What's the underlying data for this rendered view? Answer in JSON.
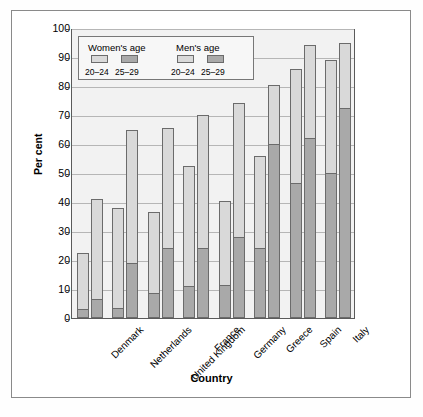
{
  "chart_data": {
    "type": "bar",
    "subtype": "grouped-stacked",
    "title": "",
    "xlabel": "Country",
    "ylabel": "Per cent",
    "ylim": [
      0,
      100
    ],
    "ytick_step": 10,
    "yticks": [
      0,
      10,
      20,
      30,
      40,
      50,
      60,
      70,
      80,
      90,
      100
    ],
    "grid": "horizontal",
    "legend_position": "top-left-inside",
    "categories": [
      "Denmark",
      "Netherlands",
      "United Kingdom",
      "France",
      "Germany",
      "Greece",
      "Spain",
      "Italy"
    ],
    "series": [
      {
        "name": "Women's age 20-24",
        "stack": "women",
        "segment": "light",
        "values": [
          19.5,
          34.5,
          28.0,
          41.5,
          29.0,
          32.0,
          39.5,
          39.0
        ]
      },
      {
        "name": "Women's age 25-29",
        "stack": "women",
        "segment": "dark",
        "values": [
          3.0,
          3.5,
          8.5,
          11.0,
          11.5,
          24.0,
          46.5,
          50.0
        ]
      },
      {
        "name": "Men's age 20-24",
        "stack": "men",
        "segment": "light",
        "values": [
          34.5,
          46.0,
          41.5,
          46.0,
          46.0,
          20.5,
          32.0,
          22.5
        ]
      },
      {
        "name": "Men's age 25-29",
        "stack": "men",
        "segment": "dark",
        "values": [
          6.5,
          19.0,
          24.0,
          24.0,
          28.0,
          60.0,
          62.0,
          72.5
        ]
      }
    ],
    "totals": {
      "women": [
        22.5,
        38.0,
        36.5,
        52.5,
        40.5,
        56.0,
        86.0,
        89.0
      ],
      "men": [
        41.0,
        65.0,
        65.5,
        70.0,
        74.0,
        80.5,
        94.0,
        95.0
      ]
    }
  },
  "legend": {
    "women_title": "Women's age",
    "men_title": "Men's age",
    "key_young": "20–24",
    "key_older": "25–29"
  },
  "colors": {
    "segment_light": "#d9d9d9",
    "segment_dark": "#a9a9a9",
    "plot_background": "#f2f2f2",
    "gridline": "#b6b6b6",
    "border": "#5a5a5a"
  }
}
